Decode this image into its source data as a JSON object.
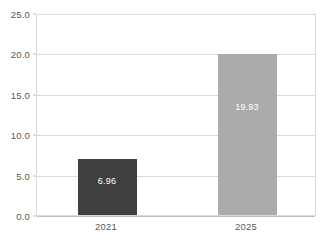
{
  "chart_data": {
    "type": "bar",
    "title": "",
    "subtitle": "",
    "xlabel": "",
    "ylabel": "",
    "categories": [
      "2021",
      "2025"
    ],
    "values": [
      6.96,
      19.93
    ],
    "value_labels": [
      "6.96",
      "19.93"
    ],
    "bar_colors": [
      "#404040",
      "#ababab"
    ],
    "ylim": [
      0,
      25
    ],
    "ytick_values": [
      0,
      5,
      10,
      15,
      20,
      25
    ],
    "ytick_labels": [
      "0.0",
      "5.0",
      "10.0",
      "15.0",
      "20.0",
      "25.0"
    ],
    "grid": true,
    "grid_axis": "y",
    "legend": false,
    "legend_position": "none",
    "data_labels_inside": true,
    "data_label_color": "#ffffff",
    "axis_text_color": "#595959",
    "plot_border_color": "#d9d9d9",
    "gridline_color": "#d9d9d9",
    "background_color": "#ffffff"
  }
}
